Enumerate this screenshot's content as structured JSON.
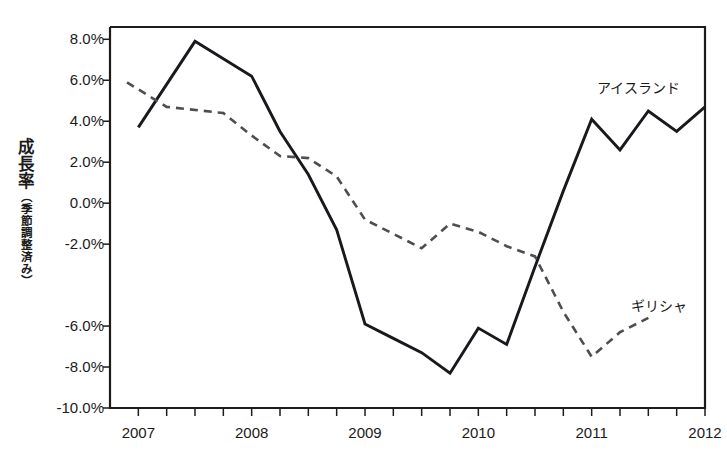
{
  "chart_data": {
    "type": "line",
    "title": "",
    "xlabel": "",
    "ylabel": "成長率（季節調整済み）",
    "ylabel_main": "成長率",
    "ylabel_sub": "（季節調整済み）",
    "grid": false,
    "legend_position": "inline-annotation",
    "xlim": [
      2006.75,
      2012.0
    ],
    "ylim": [
      -10.0,
      8.6
    ],
    "x_tick_labels": [
      "2007",
      "2008",
      "2009",
      "2010",
      "2011",
      "2012"
    ],
    "x_tick_values": [
      2007,
      2008,
      2009,
      2010,
      2011,
      2012
    ],
    "x_minor_tick_interval_years": 0.25,
    "y_tick_labels": [
      "8.0%",
      "6.0%",
      "4.0%",
      "2.0%",
      "0.0%",
      "-2.0%",
      "-6.0%",
      "-8.0%",
      "-10.0%"
    ],
    "y_tick_values": [
      8.0,
      6.0,
      4.0,
      2.0,
      0.0,
      -2.0,
      -6.0,
      -8.0,
      -10.0
    ],
    "y_unit": "%",
    "series": [
      {
        "name": "アイスランド",
        "style": "solid",
        "color": "#17191c",
        "label_x": 2011.05,
        "label_y": 5.6,
        "x": [
          2007.0,
          2007.5,
          2008.0,
          2008.25,
          2008.5,
          2008.75,
          2009.0,
          2009.25,
          2009.5,
          2009.75,
          2010.0,
          2010.25,
          2010.5,
          2010.75,
          2011.0,
          2011.25,
          2011.5,
          2011.75,
          2012.0
        ],
        "values": [
          3.7,
          7.9,
          6.2,
          3.5,
          1.4,
          -1.3,
          -5.9,
          -6.6,
          -7.3,
          -8.3,
          -6.1,
          -6.9,
          -3.1,
          0.6,
          4.1,
          2.6,
          4.5,
          3.5,
          4.7
        ]
      },
      {
        "name": "ギリシャ",
        "style": "dashed",
        "color": "#4e4e50",
        "label_x": 2011.35,
        "label_y": -5.0,
        "x": [
          2006.9,
          2007.25,
          2007.75,
          2008.0,
          2008.25,
          2008.5,
          2008.75,
          2009.0,
          2009.25,
          2009.5,
          2009.75,
          2010.0,
          2010.25,
          2010.5,
          2010.75,
          2011.0,
          2011.25,
          2011.5
        ],
        "values": [
          5.9,
          4.7,
          4.4,
          3.3,
          2.3,
          2.2,
          1.3,
          -0.8,
          -1.5,
          -2.2,
          -1.0,
          -1.4,
          -2.1,
          -2.6,
          -5.3,
          -7.5,
          -6.3,
          -5.6
        ]
      }
    ]
  },
  "annotations": {
    "iceland_label": "アイスランド",
    "greece_label": "ギリシャ"
  }
}
